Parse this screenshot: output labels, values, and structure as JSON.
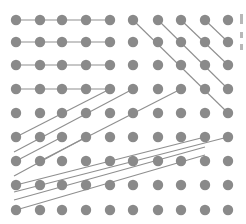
{
  "diagram": {
    "type": "dot-grid",
    "colors": {
      "dot": "#8a8a8a",
      "line": "#8f8f8f",
      "background": "#ffffff"
    },
    "dot_radius": 5.2,
    "columns_x": [
      16,
      40,
      62,
      86,
      110,
      133,
      158,
      181,
      205,
      228
    ],
    "rows_y": [
      20,
      42,
      65,
      89,
      113,
      137,
      161,
      185,
      210
    ],
    "segments": [
      {
        "x1": 16,
        "y1": 20,
        "x2": 110,
        "y2": 20
      },
      {
        "x1": 16,
        "y1": 42,
        "x2": 110,
        "y2": 42
      },
      {
        "x1": 16,
        "y1": 65,
        "x2": 110,
        "y2": 65
      },
      {
        "x1": 16,
        "y1": 89,
        "x2": 110,
        "y2": 89
      },
      {
        "x1": 133,
        "y1": 20,
        "x2": 228,
        "y2": 113
      },
      {
        "x1": 158,
        "y1": 20,
        "x2": 228,
        "y2": 89
      },
      {
        "x1": 181,
        "y1": 20,
        "x2": 228,
        "y2": 65
      },
      {
        "x1": 205,
        "y1": 20,
        "x2": 228,
        "y2": 42
      },
      {
        "x1": 16,
        "y1": 137,
        "x2": 110,
        "y2": 89
      },
      {
        "x1": 14,
        "y1": 152,
        "x2": 133,
        "y2": 89
      },
      {
        "x1": 16,
        "y1": 161,
        "x2": 62,
        "y2": 137
      },
      {
        "x1": 40,
        "y1": 161,
        "x2": 181,
        "y2": 89
      },
      {
        "x1": 14,
        "y1": 176,
        "x2": 86,
        "y2": 137
      },
      {
        "x1": 16,
        "y1": 185,
        "x2": 205,
        "y2": 137
      },
      {
        "x1": 14,
        "y1": 192,
        "x2": 228,
        "y2": 137
      },
      {
        "x1": 14,
        "y1": 200,
        "x2": 205,
        "y2": 147
      },
      {
        "x1": 16,
        "y1": 210,
        "x2": 205,
        "y2": 155
      }
    ],
    "edge_marks": [
      {
        "top": 14,
        "height": 10
      },
      {
        "top": 32,
        "height": 6
      },
      {
        "top": 44,
        "height": 6
      }
    ]
  }
}
